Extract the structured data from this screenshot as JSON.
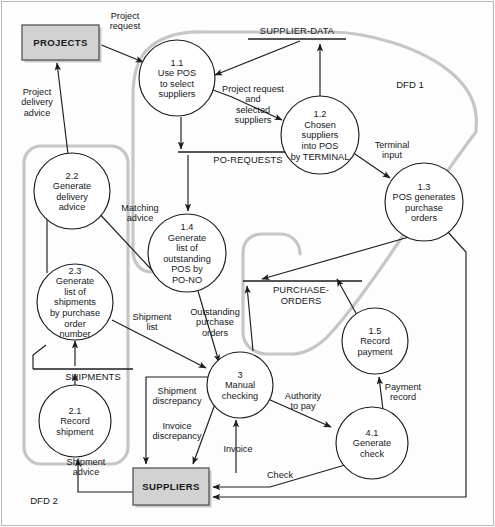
{
  "diagram": {
    "type": "data-flow-diagram",
    "colors": {
      "line": "#1b1d21",
      "boundary": "#c6c6c6",
      "entity_fill": "#d2d2d2",
      "background": "#fdfdfd"
    }
  },
  "zone_tags": [
    {
      "id": "dfd1",
      "label": "DFD 1",
      "x": 410,
      "y": 88
    },
    {
      "id": "dfd2",
      "label": "DFD 2",
      "x": 44,
      "y": 504
    }
  ],
  "external_entities": [
    {
      "id": "projects",
      "label": "PROJECTS",
      "x": 22,
      "y": 25,
      "w": 77,
      "h": 35
    },
    {
      "id": "suppliers",
      "label": "SUPPLIERS",
      "x": 133,
      "y": 468,
      "w": 76,
      "h": 37
    }
  ],
  "data_stores": [
    {
      "id": "supplier-data",
      "label": "SUPPLIER-DATA",
      "x1": 248,
      "x2": 346,
      "y": 39,
      "tx": 297,
      "ty": 34
    },
    {
      "id": "po-requests",
      "label": "PO-REQUESTS",
      "x1": 178,
      "x2": 301,
      "y": 152,
      "tx": 248,
      "ty": 163
    },
    {
      "id": "shipments",
      "label": "SHIPMENTS",
      "x1": 33,
      "x2": 133,
      "y": 369,
      "tx": 93,
      "ty": 380
    },
    {
      "id": "purchase-orders",
      "label": "PURCHASE-ORDERS",
      "x1": 243,
      "x2": 362,
      "y": 281,
      "line2": true,
      "tx": 301,
      "ty": 293,
      "tx2": 301,
      "ty2": 304
    }
  ],
  "processes": [
    {
      "id": "p1-1",
      "num": "1.1",
      "lines": [
        "Use POS",
        "to select",
        "suppliers"
      ],
      "cx": 177,
      "cy": 78,
      "r": 38
    },
    {
      "id": "p1-2",
      "num": "1.2",
      "lines": [
        "Chosen",
        "suppliers",
        "into POS",
        "by TERMINAL"
      ],
      "cx": 320,
      "cy": 135,
      "r": 39
    },
    {
      "id": "p1-3",
      "num": "1.3",
      "lines": [
        "POS generates",
        "purchase",
        "orders"
      ],
      "cx": 424,
      "cy": 202,
      "r": 39
    },
    {
      "id": "p1-4",
      "num": "1.4",
      "lines": [
        "Generate",
        "list of",
        "outstanding",
        "POS by",
        "PO-NO"
      ],
      "cx": 187,
      "cy": 253,
      "r": 39
    },
    {
      "id": "p1-5",
      "num": "1.5",
      "lines": [
        "Record",
        "payment"
      ],
      "cx": 375,
      "cy": 341,
      "r": 33
    },
    {
      "id": "p2-1",
      "num": "2.1",
      "lines": [
        "Record",
        "shipment"
      ],
      "cx": 75,
      "cy": 421,
      "r": 36
    },
    {
      "id": "p2-2",
      "num": "2.2",
      "lines": [
        "Generate",
        "delivery",
        "advice"
      ],
      "cx": 72,
      "cy": 191,
      "r": 38
    },
    {
      "id": "p2-3",
      "num": "2.3",
      "lines": [
        "Generate",
        "list of",
        "shipments",
        "by purchase",
        "order",
        "number"
      ],
      "cx": 75,
      "cy": 302,
      "r": 38
    },
    {
      "id": "p3",
      "num": "3",
      "lines": [
        "Manual",
        "checking"
      ],
      "cx": 240,
      "cy": 385,
      "r": 33
    },
    {
      "id": "p4-1",
      "num": "4.1",
      "lines": [
        "Generate",
        "check"
      ],
      "cx": 372,
      "cy": 443,
      "r": 36
    }
  ],
  "flow_labels": [
    {
      "id": "project-request",
      "lines": [
        "Project",
        "request"
      ],
      "x": 125,
      "y": 19
    },
    {
      "id": "project-delivery-advice",
      "lines": [
        "Project",
        "delivery",
        "advice"
      ],
      "x": 37,
      "y": 95
    },
    {
      "id": "project-request-and-suppliers",
      "lines": [
        "Project request",
        "and",
        "selected",
        "suppliers"
      ],
      "x": 253,
      "y": 92
    },
    {
      "id": "terminal-input",
      "lines": [
        "Terminal",
        "input"
      ],
      "x": 392,
      "y": 148
    },
    {
      "id": "matching-advice",
      "lines": [
        "Matching",
        "advice"
      ],
      "x": 140,
      "y": 211
    },
    {
      "id": "shipment-list",
      "lines": [
        "Shipment",
        "list"
      ],
      "x": 152,
      "y": 320
    },
    {
      "id": "outstanding-purchase-orders",
      "lines": [
        "Outstanding",
        "purchase",
        "orders"
      ],
      "x": 215,
      "y": 315
    },
    {
      "id": "shipment-discrepancy",
      "lines": [
        "Shipment",
        "discrepancy"
      ],
      "x": 177,
      "y": 394
    },
    {
      "id": "invoice-discrepancy",
      "lines": [
        "Invoice",
        "discrepancy"
      ],
      "x": 177,
      "y": 429
    },
    {
      "id": "invoice",
      "lines": [
        "Invoice"
      ],
      "x": 238,
      "y": 452
    },
    {
      "id": "shipment-advice",
      "lines": [
        "Shipment",
        "advice"
      ],
      "x": 86,
      "y": 465
    },
    {
      "id": "authority-to-pay",
      "lines": [
        "Authority",
        "to pay"
      ],
      "x": 303,
      "y": 399
    },
    {
      "id": "payment-record",
      "lines": [
        "Payment",
        "record"
      ],
      "x": 403,
      "y": 390
    },
    {
      "id": "check",
      "lines": [
        "Check"
      ],
      "x": 280,
      "y": 478
    }
  ]
}
